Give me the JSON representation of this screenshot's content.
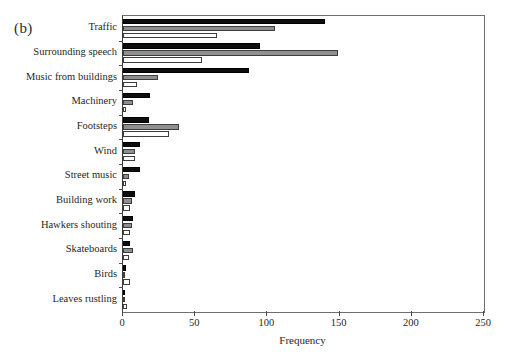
{
  "figure": {
    "panel_label": "(b)"
  },
  "chart_data": {
    "type": "bar",
    "orientation": "horizontal",
    "title": "",
    "xlabel": "Frequency",
    "ylabel": "",
    "xlim": [
      0,
      250
    ],
    "xticks": [
      0,
      50,
      100,
      150,
      200,
      250
    ],
    "xtick_labels": [
      "0",
      "50",
      "100",
      "150",
      "200",
      "250"
    ],
    "grid": false,
    "legend": "none",
    "categories": [
      "Traffic",
      "Surrounding speech",
      "Music from buildings",
      "Machinery",
      "Footsteps",
      "Wind",
      "Street music",
      "Building work",
      "Hawkers shouting",
      "Skateboards",
      "Birds",
      "Leaves rustling"
    ],
    "series": [
      {
        "name": "series-1",
        "color": "#0d0d0d",
        "style": "black",
        "values": [
          140,
          95,
          87,
          19,
          18,
          12,
          12,
          8,
          7,
          5,
          2,
          1
        ]
      },
      {
        "name": "series-2",
        "color": "#8f8f8f",
        "style": "gray",
        "values": [
          105,
          149,
          24,
          7,
          39,
          8,
          4,
          6,
          6,
          7,
          0,
          0
        ]
      },
      {
        "name": "series-3",
        "color": "#ffffff",
        "style": "white",
        "values": [
          65,
          55,
          10,
          2,
          32,
          8,
          2,
          5,
          5,
          4,
          5,
          3
        ]
      }
    ]
  }
}
